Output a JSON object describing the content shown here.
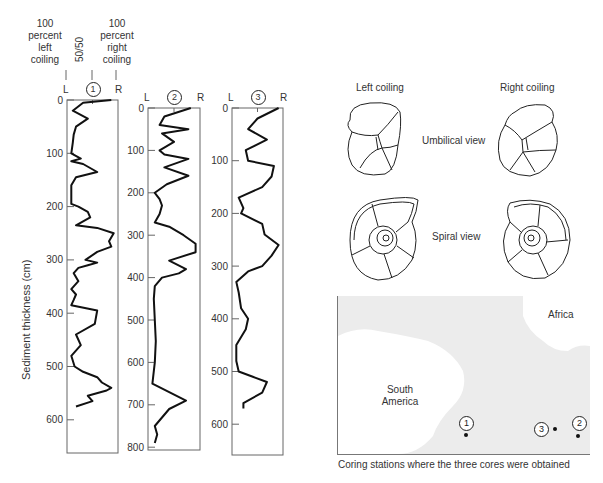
{
  "header": {
    "left_label": [
      "100",
      "percent",
      "left",
      "coiling"
    ],
    "mid_label": "50/50",
    "right_label": [
      "100",
      "percent",
      "right",
      "coiling"
    ]
  },
  "y_axis_label": "Sediment thickness (cm)",
  "chart_data": [
    {
      "type": "line",
      "title": "Core 1",
      "core_id": "1",
      "x_labels": {
        "left": "L",
        "right": "R"
      },
      "ylabel": "Sediment thickness (cm)",
      "ylim": [
        0,
        650
      ],
      "yticks": [
        0,
        100,
        200,
        300,
        400,
        500,
        600
      ],
      "x_range": [
        0,
        100
      ],
      "x_meaning": "percent right coiling",
      "depth": [
        0,
        5,
        20,
        35,
        50,
        65,
        80,
        100,
        110,
        115,
        120,
        135,
        145,
        160,
        180,
        195,
        200,
        210,
        220,
        235,
        240,
        250,
        265,
        275,
        285,
        300,
        305,
        310,
        315,
        325,
        340,
        355,
        365,
        375,
        385,
        395,
        420,
        440,
        460,
        480,
        500,
        510,
        520,
        530,
        540,
        545,
        555,
        565,
        575
      ],
      "value": [
        90,
        30,
        8,
        40,
        15,
        10,
        8,
        5,
        25,
        5,
        30,
        60,
        15,
        5,
        5,
        5,
        20,
        40,
        45,
        15,
        60,
        95,
        85,
        90,
        60,
        35,
        60,
        40,
        20,
        10,
        20,
        5,
        15,
        10,
        5,
        60,
        55,
        15,
        25,
        5,
        12,
        30,
        60,
        70,
        90,
        80,
        40,
        50,
        15
      ]
    },
    {
      "type": "line",
      "title": "Core 2",
      "core_id": "2",
      "x_labels": {
        "left": "L",
        "right": "R"
      },
      "ylim": [
        0,
        800
      ],
      "yticks": [
        0,
        100,
        200,
        300,
        400,
        500,
        600,
        700,
        800
      ],
      "x_range": [
        0,
        100
      ],
      "depth": [
        0,
        20,
        40,
        50,
        60,
        80,
        100,
        110,
        120,
        140,
        160,
        180,
        200,
        215,
        230,
        250,
        270,
        280,
        300,
        320,
        340,
        360,
        380,
        390,
        400,
        420,
        450,
        500,
        550,
        600,
        650,
        670,
        690,
        710,
        730,
        750,
        770,
        790
      ],
      "value": [
        85,
        30,
        20,
        80,
        25,
        50,
        20,
        30,
        80,
        30,
        80,
        35,
        10,
        20,
        25,
        20,
        10,
        40,
        70,
        95,
        95,
        40,
        75,
        60,
        25,
        10,
        8,
        10,
        12,
        10,
        5,
        40,
        75,
        40,
        25,
        10,
        15,
        10
      ]
    },
    {
      "type": "line",
      "title": "Core 3",
      "core_id": "3",
      "x_labels": {
        "left": "L",
        "right": "R"
      },
      "ylim": [
        0,
        650
      ],
      "yticks": [
        0,
        100,
        200,
        300,
        400,
        500,
        600
      ],
      "x_range": [
        0,
        100
      ],
      "depth": [
        0,
        20,
        40,
        60,
        80,
        100,
        110,
        130,
        150,
        170,
        190,
        200,
        220,
        240,
        260,
        280,
        300,
        310,
        330,
        350,
        380,
        400,
        420,
        450,
        480,
        500,
        510,
        520,
        540,
        560,
        570
      ],
      "value": [
        95,
        50,
        30,
        70,
        25,
        30,
        85,
        80,
        60,
        10,
        20,
        15,
        60,
        65,
        95,
        80,
        60,
        30,
        5,
        10,
        15,
        30,
        25,
        5,
        5,
        10,
        40,
        70,
        60,
        20,
        20
      ]
    }
  ],
  "foraminifera": {
    "left_title": "Left coiling",
    "right_title": "Right coiling",
    "umbilical_label": "Umbilical view",
    "spiral_label": "Spiral view"
  },
  "map": {
    "continent_1": [
      "South",
      "America"
    ],
    "continent_2": "Africa",
    "stations": [
      {
        "id": "1"
      },
      {
        "id": "2"
      },
      {
        "id": "3"
      }
    ],
    "caption": "Coring stations where the three cores were obtained",
    "ocean_color": "#ececec",
    "land_color": "#ffffff"
  }
}
